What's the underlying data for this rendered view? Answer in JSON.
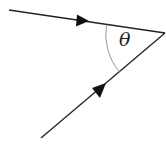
{
  "diagram": {
    "angle_label": "θ",
    "colors": {
      "line": "#222222",
      "arc": "#8a8a8a",
      "background": "#ffffff"
    },
    "vertex": {
      "x": 165,
      "y": 33
    },
    "rays": [
      {
        "name": "incoming-top",
        "from": {
          "x": 9,
          "y": 10
        },
        "to": {
          "x": 165,
          "y": 33
        },
        "arrow_direction": "toward-vertex"
      },
      {
        "name": "incoming-bottom",
        "from": {
          "x": 41,
          "y": 138
        },
        "to": {
          "x": 165,
          "y": 33
        },
        "arrow_direction": "toward-vertex"
      }
    ]
  }
}
